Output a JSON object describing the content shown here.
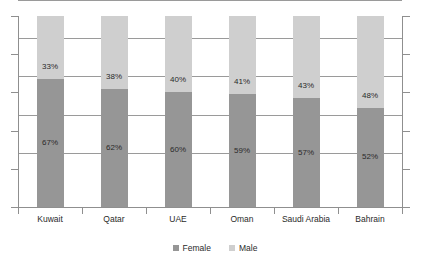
{
  "chart_data": {
    "type": "bar",
    "subtype": "100-percent-stacked-column",
    "title": "",
    "subtitle": "",
    "xlabel": "",
    "ylabel": "",
    "ylim": [
      0,
      100
    ],
    "yticks": [
      0,
      20,
      40,
      60,
      80,
      100
    ],
    "grid": true,
    "legend_position": "bottom-center",
    "categories": [
      "Kuwait",
      "Qatar",
      "UAE",
      "Oman",
      "Saudi Arabia",
      "Bahrain"
    ],
    "series": [
      {
        "name": "Female",
        "color": "#969696",
        "values": [
          67,
          62,
          60,
          59,
          57,
          52
        ],
        "labels": [
          "67%",
          "62%",
          "60%",
          "59%",
          "57%",
          "52%"
        ]
      },
      {
        "name": "Male",
        "color": "#cfcfcf",
        "values": [
          33,
          38,
          40,
          41,
          43,
          48
        ],
        "labels": [
          "33%",
          "38%",
          "40%",
          "41%",
          "43%",
          "48%"
        ]
      }
    ],
    "annotations": []
  },
  "legend": {
    "items": [
      {
        "label": "Female",
        "color": "#969696"
      },
      {
        "label": "Male",
        "color": "#cfcfcf"
      }
    ]
  },
  "axis": {
    "tick_count": 6,
    "line_color": "#8f8f8f",
    "grid_color": "#9a9a9a"
  },
  "colors": {
    "female": "#969696",
    "male": "#cfcfcf",
    "background": "#ffffff",
    "text": "#2a2a2a"
  }
}
